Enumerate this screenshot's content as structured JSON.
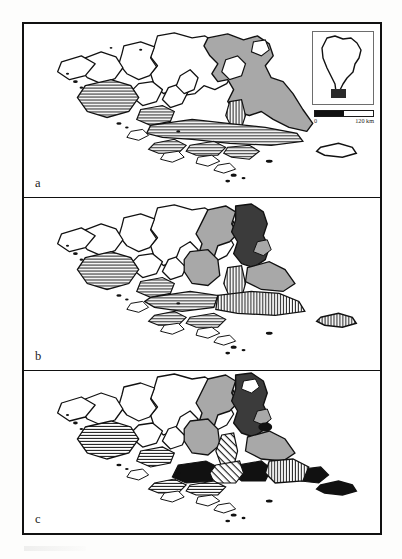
{
  "figure": {
    "panels": [
      {
        "id": "a",
        "label": "a",
        "description": "Base map of the Fuegian archipelago and southern Patagonia with light grey region and horizontal hatched islands"
      },
      {
        "id": "b",
        "label": "b",
        "description": "Same base map with an additional dark grey region and vertical hatched southern belt"
      },
      {
        "id": "c",
        "label": "c",
        "description": "Same base map with additional solid black areas and diagonal hatched areas in the south"
      }
    ],
    "inset": {
      "name": "south-america-locator",
      "description": "Outline of South America with the study area highlighted at the southern tip"
    },
    "scalebar": {
      "min_label": "0",
      "max_label": "120 km",
      "segments": 2
    },
    "colors": {
      "light_grey": "#a8a8a8",
      "dark_grey": "#3b3b3b",
      "black": "#111111",
      "white": "#ffffff",
      "frame": "#111111"
    }
  }
}
